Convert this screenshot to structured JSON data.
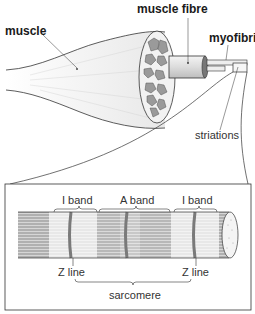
{
  "diagram": {
    "upper_labels": {
      "muscle": "muscle",
      "muscle_fibre": "muscle fibre",
      "myofibril": "myofibril",
      "striations": "striations"
    },
    "inset_labels": {
      "i_band_left": "I band",
      "a_band": "A band",
      "i_band_right": "I band",
      "z_line_left": "Z line",
      "z_line_right": "Z line",
      "sarcomere": "sarcomere"
    },
    "colors": {
      "outline": "#333333",
      "dark_band": "#8a8a8a",
      "light_band": "#e6e6e6",
      "mid_band": "#b5b5b5",
      "fibre_fill": "#9a9a9a"
    }
  }
}
